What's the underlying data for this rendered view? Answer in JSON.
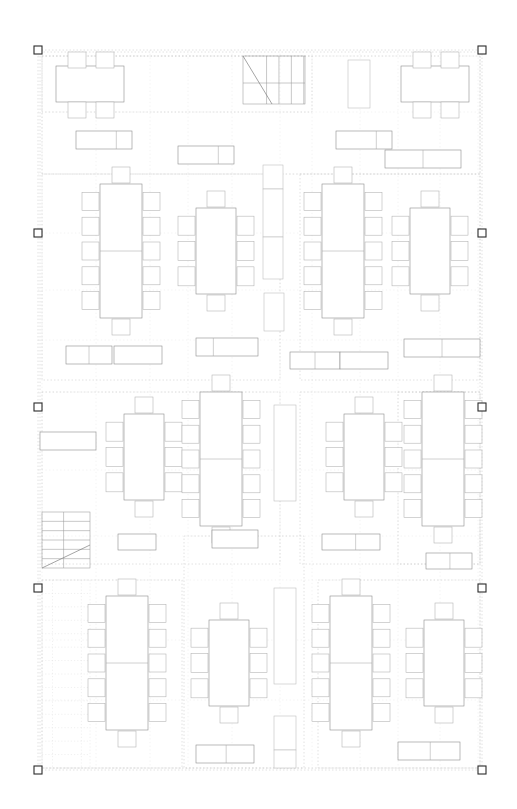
{
  "document": {
    "kind": "architectural-floor-plan",
    "title": "Office Floor Plan — Conference / Workstation Layout",
    "canvas": {
      "width": 517,
      "height": 809,
      "background": "#ffffff"
    },
    "line_colors": {
      "furniture_stroke": "#8d8d8d",
      "chair_stroke": "#b0b0b0",
      "dotted_grid": "#d9d9d9",
      "zone_dotted": "#cccccc",
      "stair_stroke": "#9a9a9a",
      "selection_handle": "#2b2b2b"
    },
    "fill": "#ffffff"
  },
  "selection": {
    "label": "selection-bounding-box",
    "bbox": {
      "x": 38,
      "y": 50,
      "width": 444,
      "height": 720
    },
    "handle_size": 8,
    "handles": [
      {
        "name": "handle-top-left",
        "x": 38,
        "y": 50
      },
      {
        "name": "handle-top-right",
        "x": 482,
        "y": 50
      },
      {
        "name": "handle-mid-left-1",
        "x": 38,
        "y": 233
      },
      {
        "name": "handle-mid-right-1",
        "x": 482,
        "y": 233
      },
      {
        "name": "handle-mid-left-2",
        "x": 38,
        "y": 407
      },
      {
        "name": "handle-mid-right-2",
        "x": 482,
        "y": 407
      },
      {
        "name": "handle-mid-left-3",
        "x": 38,
        "y": 588
      },
      {
        "name": "handle-mid-right-3",
        "x": 482,
        "y": 588
      },
      {
        "name": "handle-bottom-left",
        "x": 38,
        "y": 770
      },
      {
        "name": "handle-bottom-right",
        "x": 482,
        "y": 770
      }
    ]
  },
  "zones": [
    {
      "name": "zone-outer-boundary",
      "x": 40,
      "y": 52,
      "width": 440,
      "height": 716
    },
    {
      "name": "zone-north-corridor",
      "x": 42,
      "y": 56,
      "width": 270,
      "height": 56
    },
    {
      "name": "zone-north-band",
      "x": 42,
      "y": 56,
      "width": 438,
      "height": 118
    },
    {
      "name": "zone-left-column",
      "x": 42,
      "y": 174,
      "width": 238,
      "height": 206
    },
    {
      "name": "zone-right-column",
      "x": 300,
      "y": 174,
      "width": 180,
      "height": 206
    },
    {
      "name": "zone-mid-left",
      "x": 42,
      "y": 392,
      "width": 238,
      "height": 172
    },
    {
      "name": "zone-mid-right",
      "x": 300,
      "y": 392,
      "width": 180,
      "height": 172
    },
    {
      "name": "zone-south-left",
      "x": 42,
      "y": 580,
      "width": 140,
      "height": 188
    },
    {
      "name": "zone-south-center",
      "x": 184,
      "y": 536,
      "width": 120,
      "height": 232
    },
    {
      "name": "zone-south-right",
      "x": 318,
      "y": 580,
      "width": 162,
      "height": 188
    },
    {
      "name": "zone-east-strip",
      "x": 398,
      "y": 392,
      "width": 82,
      "height": 172
    }
  ],
  "grid_lines": {
    "vertical_x": [
      42,
      96,
      150,
      188,
      232,
      280,
      312,
      360,
      398,
      440,
      478
    ],
    "horizontal_y": [
      56,
      112,
      174,
      233,
      290,
      340,
      392,
      470,
      536,
      580,
      640,
      700,
      768
    ]
  },
  "stairs": [
    {
      "name": "stair-north-east",
      "x": 243,
      "y": 56,
      "width": 62,
      "height": 48,
      "treads": 4,
      "orientation": "vertical-treads",
      "diagonal": {
        "x1": 243,
        "y1": 56,
        "x2": 272,
        "y2": 104
      },
      "landing_line_y": 83
    },
    {
      "name": "stair-south-west",
      "x": 42,
      "y": 512,
      "width": 48,
      "height": 56,
      "treads": 5,
      "orientation": "horizontal-treads",
      "diagonal": {
        "x1": 42,
        "y1": 568,
        "x2": 90,
        "y2": 545
      },
      "landing_line_y": 545
    }
  ],
  "hatched_regions": [
    {
      "name": "hatch-south-west-stair-shaft",
      "x": 42,
      "y": 580,
      "width": 48,
      "height": 188,
      "rows": 14
    }
  ],
  "furniture": {
    "legend": {
      "conference_table_12": "12-seat conference table (2 slabs, 5 side chairs each side, 1 end chair each end)",
      "conference_table_8": "8-seat conference table (1 slab, 3 side chairs each side, 1 end chair each end)",
      "conference_table_6": "6-seat table (2 top chairs, 2 bottom chairs)",
      "credenza": "credenza / sideboard with end cabinet",
      "cabinet_tall": "tall storage cabinet",
      "bookcase": "bookcase / shelving unit"
    },
    "conference_tables": [
      {
        "name": "table-a1-12seat",
        "seats": 12,
        "table_x": 100,
        "table_y": 184,
        "table_w": 42,
        "table_h": 134,
        "split_y": 251,
        "side_chairs": 5,
        "chair_w": 17,
        "chair_h": 18,
        "end_chairs": true
      },
      {
        "name": "table-a2-8seat",
        "seats": 8,
        "table_x": 196,
        "table_y": 208,
        "table_w": 40,
        "table_h": 86,
        "split_y": null,
        "side_chairs": 3,
        "chair_w": 17,
        "chair_h": 19,
        "end_chairs": true
      },
      {
        "name": "table-a3-12seat",
        "seats": 12,
        "table_x": 322,
        "table_y": 184,
        "table_w": 42,
        "table_h": 134,
        "split_y": 251,
        "side_chairs": 5,
        "chair_w": 17,
        "chair_h": 18,
        "end_chairs": true
      },
      {
        "name": "table-a4-8seat",
        "seats": 8,
        "table_x": 410,
        "table_y": 208,
        "table_w": 40,
        "table_h": 86,
        "split_y": null,
        "side_chairs": 3,
        "chair_w": 17,
        "chair_h": 19,
        "end_chairs": true
      },
      {
        "name": "table-b1-8seat",
        "seats": 8,
        "table_x": 124,
        "table_y": 414,
        "table_w": 40,
        "table_h": 86,
        "split_y": null,
        "side_chairs": 3,
        "chair_w": 17,
        "chair_h": 19,
        "end_chairs": true
      },
      {
        "name": "table-b2-12seat",
        "seats": 12,
        "table_x": 200,
        "table_y": 392,
        "table_w": 42,
        "table_h": 134,
        "split_y": 459,
        "side_chairs": 5,
        "chair_w": 17,
        "chair_h": 18,
        "end_chairs": true
      },
      {
        "name": "table-b3-8seat",
        "seats": 8,
        "table_x": 344,
        "table_y": 414,
        "table_w": 40,
        "table_h": 86,
        "split_y": null,
        "side_chairs": 3,
        "chair_w": 17,
        "chair_h": 19,
        "end_chairs": true
      },
      {
        "name": "table-b4-12seat",
        "seats": 12,
        "table_x": 422,
        "table_y": 392,
        "table_w": 42,
        "table_h": 134,
        "split_y": 459,
        "side_chairs": 5,
        "chair_w": 17,
        "chair_h": 18,
        "end_chairs": true
      },
      {
        "name": "table-c1-12seat",
        "seats": 12,
        "table_x": 106,
        "table_y": 596,
        "table_w": 42,
        "table_h": 134,
        "split_y": 663,
        "side_chairs": 5,
        "chair_w": 17,
        "chair_h": 18,
        "end_chairs": true
      },
      {
        "name": "table-c2-8seat",
        "seats": 8,
        "table_x": 209,
        "table_y": 620,
        "table_w": 40,
        "table_h": 86,
        "split_y": null,
        "side_chairs": 3,
        "chair_w": 17,
        "chair_h": 19,
        "end_chairs": true
      },
      {
        "name": "table-c3-12seat",
        "seats": 12,
        "table_x": 330,
        "table_y": 596,
        "table_w": 42,
        "table_h": 134,
        "split_y": 663,
        "side_chairs": 5,
        "chair_w": 17,
        "chair_h": 18,
        "end_chairs": true
      },
      {
        "name": "table-c4-8seat",
        "seats": 8,
        "table_x": 424,
        "table_y": 620,
        "table_w": 40,
        "table_h": 86,
        "split_y": null,
        "side_chairs": 3,
        "chair_w": 17,
        "chair_h": 19,
        "end_chairs": true
      }
    ],
    "north_tables": [
      {
        "name": "table-n1-6seat",
        "table_x": 56,
        "table_y": 66,
        "table_w": 68,
        "table_h": 36,
        "top_chairs": [
          {
            "x": 68,
            "y": 52,
            "w": 18,
            "h": 16
          },
          {
            "x": 96,
            "y": 52,
            "w": 18,
            "h": 16
          }
        ],
        "bottom_chairs": [
          {
            "x": 68,
            "y": 102,
            "w": 18,
            "h": 16
          },
          {
            "x": 96,
            "y": 102,
            "w": 18,
            "h": 16
          }
        ]
      },
      {
        "name": "table-n2-6seat",
        "table_x": 401,
        "table_y": 66,
        "table_w": 68,
        "table_h": 36,
        "top_chairs": [
          {
            "x": 413,
            "y": 52,
            "w": 18,
            "h": 16
          },
          {
            "x": 441,
            "y": 52,
            "w": 18,
            "h": 16
          }
        ],
        "bottom_chairs": [
          {
            "x": 413,
            "y": 102,
            "w": 18,
            "h": 16
          },
          {
            "x": 441,
            "y": 102,
            "w": 18,
            "h": 16
          }
        ]
      }
    ],
    "credenzas": [
      {
        "name": "credenza-n1",
        "x": 76,
        "y": 131,
        "width": 56,
        "height": 18,
        "split_at": 0.72
      },
      {
        "name": "credenza-n2",
        "x": 178,
        "y": 146,
        "width": 56,
        "height": 18,
        "split_at": 0.72
      },
      {
        "name": "credenza-n3",
        "x": 336,
        "y": 131,
        "width": 56,
        "height": 18,
        "split_at": 0.72
      },
      {
        "name": "credenza-n4",
        "x": 385,
        "y": 150,
        "width": 76,
        "height": 18,
        "split_at": 0.5
      },
      {
        "name": "credenza-m1",
        "x": 66,
        "y": 346,
        "width": 46,
        "height": 18,
        "split_at": 0.5
      },
      {
        "name": "credenza-m2",
        "x": 114,
        "y": 346,
        "width": 48,
        "height": 18,
        "split_at": 1.0
      },
      {
        "name": "credenza-m3",
        "x": 196,
        "y": 338,
        "width": 62,
        "height": 18,
        "split_at": 0.28
      },
      {
        "name": "credenza-m4",
        "x": 290,
        "y": 352,
        "width": 50,
        "height": 17,
        "split_at": 0.5
      },
      {
        "name": "credenza-m5",
        "x": 340,
        "y": 352,
        "width": 48,
        "height": 17,
        "split_at": 1.0
      },
      {
        "name": "credenza-m6",
        "x": 404,
        "y": 339,
        "width": 76,
        "height": 18,
        "split_at": 0.5
      },
      {
        "name": "credenza-l1",
        "x": 40,
        "y": 432,
        "width": 56,
        "height": 18,
        "split_at": 1.0
      },
      {
        "name": "credenza-k1",
        "x": 118,
        "y": 534,
        "width": 38,
        "height": 16,
        "split_at": 1.0
      },
      {
        "name": "credenza-k2",
        "x": 212,
        "y": 530,
        "width": 46,
        "height": 18,
        "split_at": 1.0
      },
      {
        "name": "credenza-k3",
        "x": 322,
        "y": 534,
        "width": 58,
        "height": 16,
        "split_at": 0.58
      },
      {
        "name": "credenza-k4",
        "x": 426,
        "y": 553,
        "width": 46,
        "height": 16,
        "split_at": 0.52
      },
      {
        "name": "credenza-s1",
        "x": 196,
        "y": 745,
        "width": 58,
        "height": 18,
        "split_at": 0.52
      },
      {
        "name": "credenza-s2",
        "x": 398,
        "y": 742,
        "width": 62,
        "height": 18,
        "split_at": 0.52
      }
    ],
    "cabinets": [
      {
        "name": "cabinet-n-tall-1",
        "x": 348,
        "y": 60,
        "width": 22,
        "height": 48
      },
      {
        "name": "cabinet-m-tall-1",
        "x": 263,
        "y": 165,
        "width": 20,
        "height": 24
      },
      {
        "name": "cabinet-m-tall-2",
        "x": 263,
        "y": 189,
        "width": 20,
        "height": 48
      },
      {
        "name": "cabinet-m-tall-3",
        "x": 263,
        "y": 237,
        "width": 20,
        "height": 42
      },
      {
        "name": "cabinet-m-tall-4",
        "x": 264,
        "y": 293,
        "width": 20,
        "height": 38
      },
      {
        "name": "cabinet-b-tall-1",
        "x": 274,
        "y": 405,
        "width": 22,
        "height": 96
      },
      {
        "name": "cabinet-c-tall-1",
        "x": 274,
        "y": 588,
        "width": 22,
        "height": 96
      },
      {
        "name": "cabinet-c-tall-2",
        "x": 274,
        "y": 716,
        "width": 22,
        "height": 34
      },
      {
        "name": "cabinet-c-tall-3",
        "x": 274,
        "y": 750,
        "width": 22,
        "height": 18
      }
    ]
  }
}
